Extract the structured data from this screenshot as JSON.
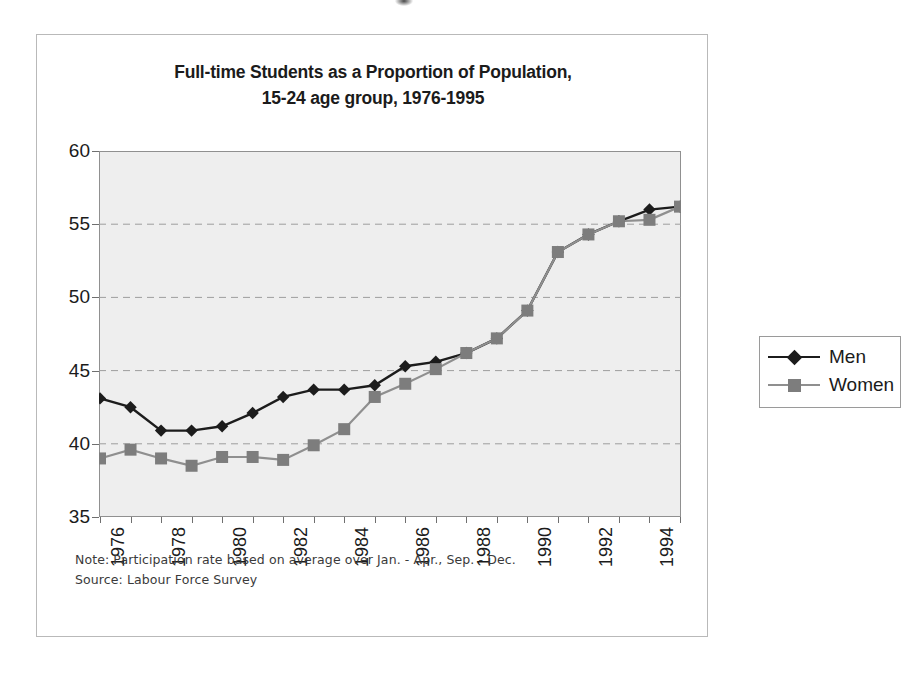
{
  "figure": {
    "title_line1": "Full-time Students as a Proportion of Population,",
    "title_line2": "15-24 age group, 1976-1995"
  },
  "legend": {
    "position": "right",
    "entries": [
      {
        "label": "Men",
        "color": "#1c1c1c",
        "marker": "diamond"
      },
      {
        "label": "Women",
        "color": "#7d7d7d",
        "marker": "square"
      }
    ]
  },
  "notes": {
    "note": "Note:  Participation rate based on average over Jan. - Apr., Sep. - Dec.",
    "source": "Source:  Labour Force Survey"
  },
  "ghost": {
    "line1": "",
    "line2": ""
  },
  "chart_data": {
    "type": "line",
    "title": "Full-time Students as a Proportion of Population, 15-24 age group, 1976-1995",
    "xlabel": "",
    "ylabel": "",
    "ylim": [
      35,
      60
    ],
    "yticks": [
      35,
      40,
      45,
      50,
      55,
      60
    ],
    "grid": true,
    "grid_style": "dashed-horizontal",
    "x": [
      1976,
      1977,
      1978,
      1979,
      1980,
      1981,
      1982,
      1983,
      1984,
      1985,
      1986,
      1987,
      1988,
      1989,
      1990,
      1991,
      1992,
      1993,
      1994,
      1995
    ],
    "xtick_labels": [
      "1976",
      "1978",
      "1980",
      "1982",
      "1984",
      "1986",
      "1988",
      "1990",
      "1992",
      "1994"
    ],
    "xtick_values": [
      1976,
      1978,
      1980,
      1982,
      1984,
      1986,
      1988,
      1990,
      1992,
      1994
    ],
    "xtick_rotation": 90,
    "series": [
      {
        "name": "Men",
        "color": "#1c1c1c",
        "marker": "diamond",
        "values": [
          43.1,
          42.5,
          40.9,
          40.9,
          41.2,
          42.1,
          43.2,
          43.7,
          43.7,
          44.0,
          45.3,
          45.6,
          46.2,
          47.2,
          49.1,
          53.1,
          54.3,
          55.2,
          56.0,
          56.2
        ]
      },
      {
        "name": "Women",
        "color": "#7d7d7d",
        "marker": "square",
        "values": [
          39.0,
          39.6,
          39.0,
          38.5,
          39.1,
          39.1,
          38.9,
          39.9,
          41.0,
          43.2,
          44.1,
          45.1,
          46.2,
          47.2,
          49.1,
          53.1,
          54.3,
          55.2,
          55.3,
          56.2
        ]
      }
    ]
  }
}
